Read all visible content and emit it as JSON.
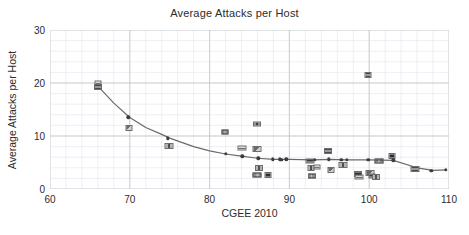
{
  "chart_data": {
    "type": "scatter",
    "title": "Average Attacks per Host",
    "xlabel": "CGEE 2010",
    "ylabel": "Average Attacks per Host",
    "xlim": [
      60,
      110
    ],
    "ylim": [
      0,
      30
    ],
    "xticks": [
      60,
      70,
      80,
      90,
      100,
      110
    ],
    "yticks": [
      0,
      10,
      20,
      30
    ],
    "grid": true,
    "minor_grid": true,
    "legend": null,
    "marker_style": "country-flag-image",
    "points": [
      {
        "x": 66.0,
        "y": 20.0
      },
      {
        "x": 66.0,
        "y": 19.2
      },
      {
        "x": 69.8,
        "y": 13.5
      },
      {
        "x": 69.9,
        "y": 11.6
      },
      {
        "x": 74.8,
        "y": 9.6
      },
      {
        "x": 74.9,
        "y": 8.1
      },
      {
        "x": 81.9,
        "y": 10.8
      },
      {
        "x": 82.0,
        "y": 6.6
      },
      {
        "x": 84.0,
        "y": 7.7
      },
      {
        "x": 84.1,
        "y": 6.2
      },
      {
        "x": 85.9,
        "y": 12.2
      },
      {
        "x": 86.0,
        "y": 7.6
      },
      {
        "x": 86.1,
        "y": 5.8
      },
      {
        "x": 86.2,
        "y": 3.9
      },
      {
        "x": 86.0,
        "y": 2.6
      },
      {
        "x": 87.3,
        "y": 2.6
      },
      {
        "x": 87.9,
        "y": 5.6
      },
      {
        "x": 88.8,
        "y": 5.6
      },
      {
        "x": 89.0,
        "y": 5.5
      },
      {
        "x": 89.6,
        "y": 5.6
      },
      {
        "x": 92.6,
        "y": 5.3
      },
      {
        "x": 92.7,
        "y": 4.0
      },
      {
        "x": 92.8,
        "y": 2.4
      },
      {
        "x": 93.2,
        "y": 5.5
      },
      {
        "x": 93.4,
        "y": 4.2
      },
      {
        "x": 94.8,
        "y": 7.1
      },
      {
        "x": 94.9,
        "y": 5.6
      },
      {
        "x": 95.2,
        "y": 3.6
      },
      {
        "x": 96.5,
        "y": 5.5
      },
      {
        "x": 96.7,
        "y": 4.5
      },
      {
        "x": 97.2,
        "y": 5.5
      },
      {
        "x": 98.6,
        "y": 2.8
      },
      {
        "x": 98.7,
        "y": 2.3
      },
      {
        "x": 99.9,
        "y": 21.5
      },
      {
        "x": 99.9,
        "y": 5.5
      },
      {
        "x": 100.1,
        "y": 3.1
      },
      {
        "x": 100.4,
        "y": 2.5
      },
      {
        "x": 100.8,
        "y": 2.3
      },
      {
        "x": 101.2,
        "y": 5.2
      },
      {
        "x": 102.9,
        "y": 6.2
      },
      {
        "x": 103.0,
        "y": 5.4
      },
      {
        "x": 105.8,
        "y": 3.8
      },
      {
        "x": 107.8,
        "y": 3.4
      },
      {
        "x": 109.6,
        "y": 3.6
      }
    ],
    "fit_curve": {
      "style": "solid gray line through fitted means",
      "points": [
        {
          "x": 66.0,
          "y": 19.4
        },
        {
          "x": 68.0,
          "y": 16.2
        },
        {
          "x": 70.0,
          "y": 13.5
        },
        {
          "x": 72.0,
          "y": 11.6
        },
        {
          "x": 74.0,
          "y": 10.3
        },
        {
          "x": 75.0,
          "y": 9.6
        },
        {
          "x": 78.0,
          "y": 8.0
        },
        {
          "x": 80.0,
          "y": 7.2
        },
        {
          "x": 82.0,
          "y": 6.6
        },
        {
          "x": 84.0,
          "y": 6.2
        },
        {
          "x": 86.0,
          "y": 5.8
        },
        {
          "x": 88.0,
          "y": 5.6
        },
        {
          "x": 90.0,
          "y": 5.6
        },
        {
          "x": 93.0,
          "y": 5.5
        },
        {
          "x": 95.0,
          "y": 5.6
        },
        {
          "x": 97.0,
          "y": 5.5
        },
        {
          "x": 100.0,
          "y": 5.5
        },
        {
          "x": 103.0,
          "y": 5.4
        },
        {
          "x": 106.0,
          "y": 4.0
        },
        {
          "x": 108.0,
          "y": 3.5
        },
        {
          "x": 109.7,
          "y": 3.6
        }
      ]
    }
  },
  "axis": {
    "y_labels": [
      "30",
      "20",
      "10",
      "0"
    ],
    "x_labels": [
      "60",
      "70",
      "80",
      "90",
      "100",
      "110"
    ]
  },
  "colors": {
    "title": "#2b2b2b",
    "grid_major": "#c9c9c9",
    "grid_minor": "#e4eaf0",
    "curve": "#6a6a6a",
    "dot": "#3d3d3d",
    "marker_fill": "#8a8a8a",
    "marker_border": "#6d6d6d",
    "background": "#ffffff"
  }
}
